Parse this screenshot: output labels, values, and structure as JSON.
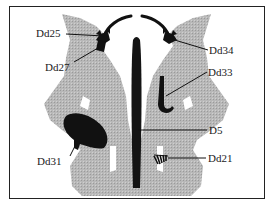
{
  "diagram": {
    "type": "inkblot-location-chart",
    "colors": {
      "blot": "#b3b3b3",
      "detail": "#111111",
      "frame": "#222222"
    },
    "labels": [
      {
        "id": "Dd25",
        "text": "Dd25"
      },
      {
        "id": "Dd27",
        "text": "Dd27"
      },
      {
        "id": "Dd34",
        "text": "Dd34"
      },
      {
        "id": "Dd33",
        "text": "Dd33"
      },
      {
        "id": "D5",
        "text": "D5"
      },
      {
        "id": "Dd31",
        "text": "Dd31"
      },
      {
        "id": "Dd21",
        "text": "Dd21"
      }
    ]
  }
}
